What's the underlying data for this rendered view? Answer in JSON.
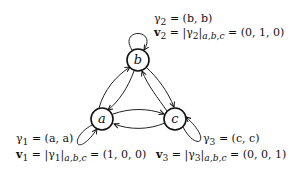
{
  "nodes": [
    {
      "id": "a",
      "label": "a"
    },
    {
      "id": "b",
      "label": "b"
    },
    {
      "id": "c",
      "label": "c"
    }
  ],
  "loops": {
    "a": {
      "gamma": "γ1 = (a, a)",
      "v": "v1 = |γ1|a,b,c = (1, 0, 0)"
    },
    "b": {
      "gamma": "γ2 = (b, b)",
      "v": "v2 = |γ2|a,b,c = (0, 1, 0)"
    },
    "c": {
      "gamma": "γ3 = (c, c)",
      "v": "v3 = |γ3|a,b,c = (0, 0, 1)"
    }
  },
  "labels": {
    "g1_sym": "γ",
    "g1_sub": "1",
    "g1_rest": " = (a, a)",
    "v1_sym": "v",
    "v1_sub": "1",
    "v1_mid": " = |γ",
    "v1_sub2": "1",
    "v1_sub3": "a,b,c",
    "v1_rest": " = (1, 0, 0)",
    "g2_sym": "γ",
    "g2_sub": "2",
    "g2_rest": " = (b, b)",
    "v2_sym": "v",
    "v2_sub": "2",
    "v2_mid": " = |γ",
    "v2_sub2": "2",
    "v2_sub3": "a,b,c",
    "v2_rest": " = (0, 1, 0)",
    "g3_sym": "γ",
    "g3_sub": "3",
    "g3_rest": " = (c, c)",
    "v3_sym": "v",
    "v3_sub": "3",
    "v3_mid": " = |γ",
    "v3_sub2": "3",
    "v3_sub3": "a,b,c",
    "v3_rest": " = (0, 0, 1)"
  },
  "edges": [
    "a->b",
    "b->a",
    "b->c",
    "c->b",
    "a->c",
    "c->a",
    "a->a",
    "b->b",
    "c->c"
  ]
}
